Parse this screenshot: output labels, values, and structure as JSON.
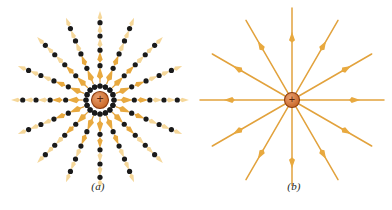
{
  "figure": {
    "background_color": "#ffffff",
    "width": 392,
    "height": 210
  },
  "colors": {
    "field_line": "#E2A23C",
    "field_line_light": "#F2CE86",
    "arrow_head": "#E8A93F",
    "arrow_head_light": "#F5D79A",
    "sample_dot": "#1A1A1A",
    "charge_fill_outer": "#C6601E",
    "charge_fill_inner": "#E8A070",
    "charge_ring": "#8C3D11",
    "charge_sign": "#5A2408",
    "label_text": "#231F20"
  },
  "panels": [
    {
      "id": "a",
      "label": "(a)",
      "caption": "Field vectors sampled at discrete points",
      "representation": "field-vectors",
      "center": {
        "x": 100,
        "y": 100
      },
      "ray_count": 16,
      "ray_angle_step_deg": 22.5,
      "ray_start_angle_deg": 0,
      "inner_radius": 14,
      "outer_radius": 90,
      "vectors_per_ray": 5,
      "dot_radius_px": 2.6,
      "charge": {
        "sign": "+",
        "radius": 8.5
      }
    },
    {
      "id": "b",
      "label": "(b)",
      "caption": "Continuous field lines",
      "representation": "field-lines",
      "center": {
        "x": 96,
        "y": 100
      },
      "ray_count": 12,
      "ray_angle_step_deg": 30,
      "ray_start_angle_deg": 0,
      "inner_radius": 7,
      "outer_radius": 92,
      "arrow_position_fraction": 0.62,
      "charge": {
        "sign": "+",
        "radius": 7.5
      }
    }
  ],
  "chart_data": {
    "type": "diagram",
    "panels": [
      {
        "key": "a",
        "label": "(a)",
        "style": "discrete field vectors with sample dots",
        "rays": 16,
        "angle_step_deg": 22.5,
        "samples_per_ray": 5,
        "direction": "radially outward",
        "charge_polarity": "+"
      },
      {
        "key": "b",
        "label": "(b)",
        "style": "continuous field lines with single arrowheads",
        "rays": 12,
        "angle_step_deg": 30,
        "samples_per_ray": 1,
        "direction": "radially outward",
        "charge_polarity": "+"
      }
    ]
  }
}
